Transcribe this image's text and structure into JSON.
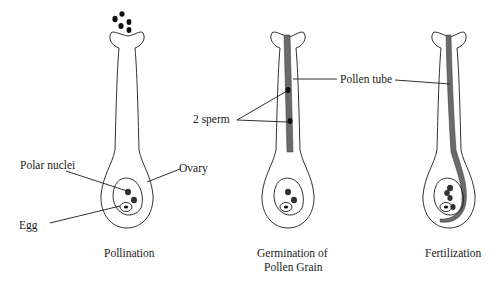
{
  "diagram": {
    "panels": [
      {
        "caption_lines": [
          "Pollination"
        ],
        "labels": {
          "polar_nuclei": "Polar nuclei",
          "ovary": "Ovary",
          "egg": "Egg"
        }
      },
      {
        "caption_lines": [
          "Germination of",
          "Pollen Grain"
        ],
        "labels": {
          "sperm": "2 sperm",
          "pollen_tube": "Pollen tube"
        }
      },
      {
        "caption_lines": [
          "Fertilization"
        ],
        "labels": {
          "pollen_tube": "Pollen tube"
        }
      }
    ],
    "colors": {
      "pollen_tube": "#6b6b6b",
      "outline": "#1a1a1a",
      "nuclei": "#333333"
    }
  }
}
